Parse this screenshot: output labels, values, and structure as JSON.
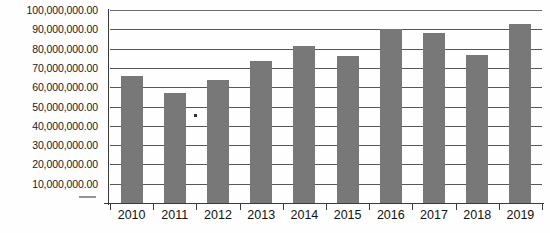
{
  "chart_data": {
    "type": "bar",
    "title": "",
    "xlabel": "",
    "ylabel": "",
    "categories": [
      "2010",
      "2011",
      "2012",
      "2013",
      "2014",
      "2015",
      "2016",
      "2017",
      "2018",
      "2019"
    ],
    "values": [
      66000000,
      57000000,
      63500000,
      73500000,
      81500000,
      76000000,
      90000000,
      88000000,
      76500000,
      93000000
    ],
    "ylim": [
      0,
      100000000
    ],
    "ytick_values": [
      10000000,
      20000000,
      30000000,
      40000000,
      50000000,
      60000000,
      70000000,
      80000000,
      90000000,
      100000000
    ],
    "ytick_labels": [
      "10,000,000.00",
      "20,000,000.00",
      "30,000,000.00",
      "40,000,000.00",
      "50,000,000.00",
      "60,000,000.00",
      "70,000,000.00",
      "80,000,000.00",
      "90,000,000.00",
      "100,000,000.00"
    ],
    "grid": true,
    "legend": false,
    "legend_position": "none",
    "bar_color": "#787878",
    "gridline_color": "#55585a",
    "axis_color": "#3a3a3a",
    "background_color": "#ffffff"
  }
}
